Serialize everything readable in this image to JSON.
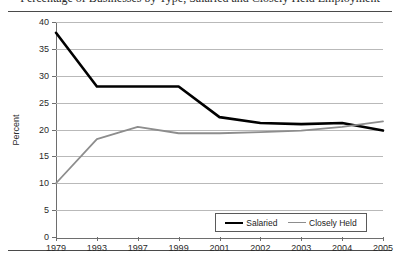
{
  "figure": {
    "title_partial": "Percentage of Businesses by Type, Salaried and Closely Held Employment",
    "y_axis_title": "Percent"
  },
  "legend": {
    "position": "bottom-right-inside",
    "items": [
      {
        "label": "Salaried",
        "color": "#000000",
        "swatch": "salaried"
      },
      {
        "label": "Closely Held",
        "color": "#8d8d8d",
        "swatch": "closely"
      }
    ]
  },
  "chart_data": {
    "type": "line",
    "title": "",
    "xlabel": "",
    "ylabel": "Percent",
    "grid": true,
    "legend_position": "lower right",
    "ylim": [
      0,
      40
    ],
    "yticks": [
      0,
      5,
      10,
      15,
      20,
      25,
      30,
      35,
      40
    ],
    "ytick_labels": [
      "0",
      "5",
      "10",
      "15",
      "20",
      "25",
      "30",
      "35",
      "40"
    ],
    "categories": [
      "1979",
      "1993",
      "1997",
      "1999",
      "2001",
      "2002",
      "2003",
      "2004",
      "2005"
    ],
    "series": [
      {
        "name": "Salaried",
        "color": "#000000",
        "width": 2.6,
        "values": [
          38.0,
          28.0,
          28.0,
          28.0,
          22.3,
          21.2,
          21.0,
          21.2,
          19.8
        ]
      },
      {
        "name": "Closely Held",
        "color": "#8d8d8d",
        "width": 1.8,
        "values": [
          10.0,
          18.2,
          20.5,
          19.3,
          19.3,
          19.5,
          19.8,
          20.5,
          21.5
        ]
      }
    ]
  }
}
